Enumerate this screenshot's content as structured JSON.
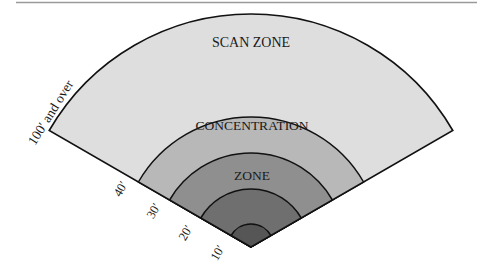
{
  "diagram": {
    "type": "radial-zones",
    "zones": [
      {
        "name": "scan-zone",
        "label": "SCAN ZONE",
        "range_label": "100′ and over",
        "fill": "#dededf"
      },
      {
        "name": "ring-40",
        "range_label": "40′",
        "fill": "#b8b8b8"
      },
      {
        "name": "ring-30",
        "range_label": "30′",
        "fill": "#8f8f8f"
      },
      {
        "name": "ring-20",
        "range_label": "20′",
        "fill": "#6f6f6f"
      },
      {
        "name": "ring-10",
        "range_label": "10′",
        "fill": "#565656"
      }
    ],
    "concentration_label_line1": "CONCENTRATION",
    "concentration_label_line2": "ZONE",
    "stroke": "#111111",
    "rule_color": "#9a9a9a"
  }
}
